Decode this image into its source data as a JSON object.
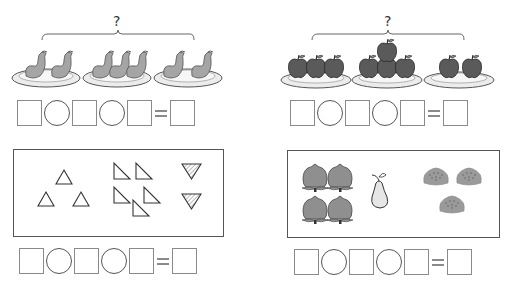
{
  "problems": [
    {
      "id": "top-left",
      "question_mark": "?",
      "subject": "bananas-on-plates",
      "groups": [
        2,
        3,
        2
      ],
      "equation": {
        "slots": [
          "box",
          "circle",
          "box",
          "circle",
          "box",
          "equals",
          "box"
        ],
        "equals_sign": "="
      }
    },
    {
      "id": "top-right",
      "question_mark": "?",
      "subject": "apples-on-plates",
      "groups": [
        3,
        4,
        2
      ],
      "equation": {
        "slots": [
          "box",
          "circle",
          "box",
          "circle",
          "box",
          "equals",
          "box"
        ],
        "equals_sign": "="
      }
    },
    {
      "id": "bottom-left",
      "subject": "triangles",
      "groups": [
        {
          "shape": "upright-triangle",
          "count": 3
        },
        {
          "shape": "right-triangle",
          "count": 5
        },
        {
          "shape": "hatched-inverted-triangle",
          "count": 2
        }
      ],
      "equation": {
        "slots": [
          "box",
          "circle",
          "box",
          "circle",
          "box",
          "equals",
          "box"
        ],
        "equals_sign": "="
      }
    },
    {
      "id": "bottom-right",
      "subject": "fruits",
      "groups": [
        {
          "shape": "peach",
          "count": 4
        },
        {
          "shape": "pear",
          "count": 1
        },
        {
          "shape": "bun",
          "count": 3
        }
      ],
      "equation": {
        "slots": [
          "box",
          "circle",
          "box",
          "circle",
          "box",
          "equals",
          "box"
        ],
        "equals_sign": "="
      }
    }
  ],
  "colors": {
    "fruit_dark": "#5a5a5a",
    "fruit_mid": "#8f8f8f",
    "banana": "#a5a5a5",
    "plate": "#e4e4e4",
    "pear": "#e6e6e6",
    "hatch": "#777777",
    "box_border": "#8a8a8a"
  }
}
